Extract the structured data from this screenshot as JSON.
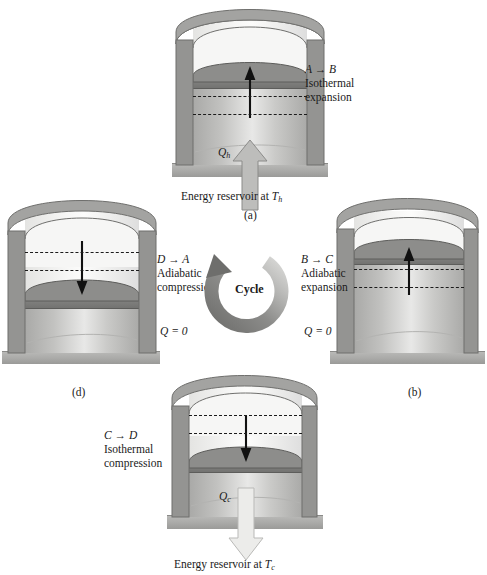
{
  "figure": {
    "cycle_label": "Cycle",
    "colors": {
      "wall": "#989896",
      "piston": "#7e7e7c",
      "gas": "#c8c8c6",
      "base": "#aeaeac",
      "heat_in_arrow": "#b4b4b2",
      "heat_out_arrow": "#e6e6e4",
      "text": "#1a1a1a"
    }
  },
  "panels": {
    "a": {
      "id": "(a)",
      "process": "A → B",
      "name_line1": "Isothermal",
      "name_line2": "expansion",
      "heat_symbol": "Q",
      "heat_sub": "h",
      "reservoir": "Energy reservoir at",
      "reservoir_symbol": "T",
      "reservoir_sub": "h",
      "piston_direction": "up",
      "heat_direction": "in"
    },
    "b": {
      "id": "(b)",
      "process": "B → C",
      "name_line1": "Adiabatic",
      "name_line2": "expansion",
      "q_note": "Q = 0",
      "piston_direction": "up",
      "heat_direction": "none"
    },
    "c": {
      "id": "(c)",
      "process": "C → D",
      "name_line1": "Isothermal",
      "name_line2": "compression",
      "heat_symbol": "Q",
      "heat_sub": "c",
      "reservoir": "Energy reservoir at",
      "reservoir_symbol": "T",
      "reservoir_sub": "c",
      "piston_direction": "down",
      "heat_direction": "out"
    },
    "d": {
      "id": "(d)",
      "process": "D → A",
      "name_line1": "Adiabatic",
      "name_line2": "compression",
      "q_note": "Q = 0",
      "piston_direction": "down",
      "heat_direction": "none"
    }
  }
}
